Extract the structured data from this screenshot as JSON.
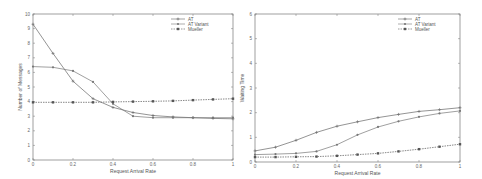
{
  "chart_data": [
    {
      "type": "line",
      "title": "",
      "xlabel": "Request Arrival Rate",
      "ylabel": "Number of Messages",
      "xlim": [
        0,
        1
      ],
      "ylim": [
        0,
        10
      ],
      "xticks": [
        "0",
        "0.2",
        "0.4",
        "0.6",
        "0.8",
        "1"
      ],
      "yticks": [
        "0",
        "1",
        "2",
        "3",
        "4",
        "5",
        "6",
        "7",
        "8",
        "9",
        "10"
      ],
      "grid": false,
      "legend_position": "upper right",
      "x": [
        0,
        0.1,
        0.2,
        0.3,
        0.4,
        0.5,
        0.6,
        0.7,
        0.8,
        0.9,
        1.0
      ],
      "series": [
        {
          "name": "AT",
          "marker": "+",
          "values": [
            9.3,
            7.3,
            5.4,
            4.2,
            3.6,
            3.25,
            3.05,
            2.95,
            2.9,
            2.85,
            2.82
          ]
        },
        {
          "name": "AT Variant",
          "marker": "o",
          "values": [
            6.4,
            6.35,
            6.1,
            5.35,
            3.85,
            3.0,
            2.9,
            2.9,
            2.9,
            2.9,
            2.9
          ]
        },
        {
          "name": "Mueller",
          "marker": "*",
          "values": [
            3.95,
            3.95,
            3.95,
            3.95,
            3.98,
            4.0,
            4.02,
            4.05,
            4.1,
            4.15,
            4.2
          ]
        }
      ]
    },
    {
      "type": "line",
      "title": "",
      "xlabel": "Request Arrival Rate",
      "ylabel": "Waiting Time",
      "xlim": [
        0,
        1
      ],
      "ylim": [
        0,
        6
      ],
      "xticks": [
        "0",
        "0.2",
        "0.4",
        "0.6",
        "0.8",
        "1"
      ],
      "yticks": [
        "0",
        "1",
        "2",
        "3",
        "4",
        "5",
        "6"
      ],
      "grid": false,
      "legend_position": "upper right",
      "x": [
        0,
        0.1,
        0.2,
        0.3,
        0.4,
        0.5,
        0.6,
        0.7,
        0.8,
        0.9,
        1.0
      ],
      "series": [
        {
          "name": "AT",
          "marker": "+",
          "values": [
            0.45,
            0.6,
            0.88,
            1.2,
            1.45,
            1.63,
            1.8,
            1.93,
            2.05,
            2.12,
            2.2
          ]
        },
        {
          "name": "AT Variant",
          "marker": "o",
          "values": [
            0.3,
            0.32,
            0.35,
            0.43,
            0.7,
            1.1,
            1.42,
            1.65,
            1.83,
            1.97,
            2.07
          ]
        },
        {
          "name": "Mueller",
          "marker": "*",
          "values": [
            0.2,
            0.2,
            0.21,
            0.22,
            0.25,
            0.3,
            0.35,
            0.43,
            0.52,
            0.62,
            0.72
          ]
        }
      ]
    }
  ],
  "colors": {
    "axis": "#777777",
    "AT": "#666666",
    "AT Variant": "#777777",
    "Mueller": "#555555"
  }
}
